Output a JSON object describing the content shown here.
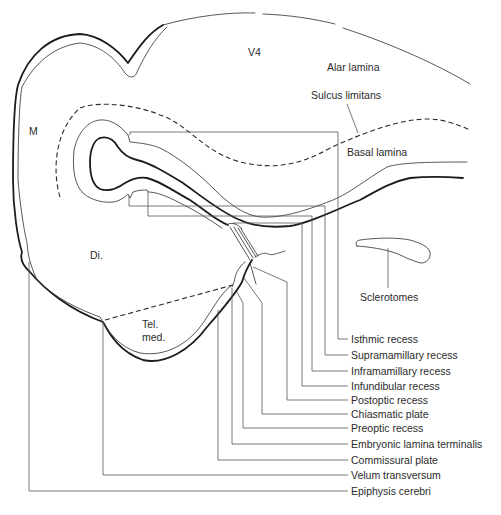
{
  "diagram": {
    "region_labels": {
      "v4": "V4",
      "m": "M",
      "di": "Di.",
      "tel": "Tel.",
      "med": "med.",
      "alar_lamina": "Alar lamina",
      "sulcus_limitans": "Sulcus limitans",
      "basal_lamina": "Basal lamina",
      "sclerotomes": "Sclerotomes"
    },
    "leader_labels": [
      {
        "label": "Isthmic recess"
      },
      {
        "label": "Supramamillary recess"
      },
      {
        "label": "Inframamillary recess"
      },
      {
        "label": "Infundibular recess"
      },
      {
        "label": "Postoptic recess"
      },
      {
        "label": "Chiasmatic plate"
      },
      {
        "label": "Preoptic recess"
      },
      {
        "label": "Embryonic lamina terminalis"
      },
      {
        "label": "Commissural plate"
      },
      {
        "label": "Velum transversum"
      },
      {
        "label": "Epiphysis cerebri"
      }
    ]
  }
}
